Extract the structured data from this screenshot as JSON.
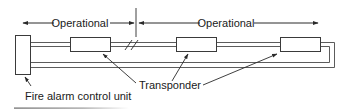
{
  "diagram": {
    "labels": {
      "operational_left": "Operational",
      "operational_right": "Operational",
      "transponder": "Transponder",
      "control_unit": "Fire alarm control unit"
    },
    "colors": {
      "stroke": "#3a3a3a",
      "text": "#1a1a1a",
      "background": "#ffffff"
    },
    "components": {
      "control_unit_count": 1,
      "transponder_count": 3
    }
  }
}
